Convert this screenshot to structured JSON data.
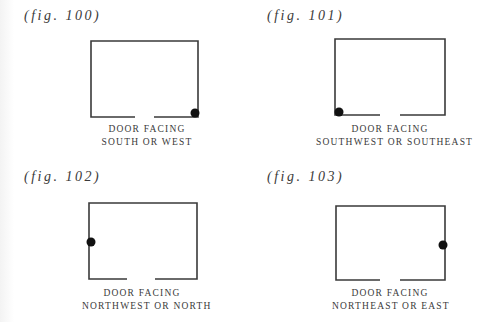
{
  "figures": [
    {
      "label": "(fig. 100)",
      "caption_line1": "DOOR FACING",
      "caption_line2": "SOUTH OR WEST",
      "room": {
        "left": 91,
        "top": 41,
        "right": 198,
        "bottom": 117,
        "door_gap": [
          135,
          154
        ]
      },
      "marker": {
        "x": 195,
        "y": 113,
        "position": "bottom-right corner"
      }
    },
    {
      "label": "(fig. 101)",
      "caption_line1": "DOOR FACING",
      "caption_line2": "SOUTHWEST OR SOUTHEAST",
      "room": {
        "left": 335,
        "top": 39,
        "right": 445,
        "bottom": 115,
        "door_gap": [
          380,
          400
        ]
      },
      "marker": {
        "x": 339,
        "y": 112,
        "position": "bottom-left corner"
      }
    },
    {
      "label": "(fig. 102)",
      "caption_line1": "DOOR FACING",
      "caption_line2": "NORTHWEST OR NORTH",
      "room": {
        "left": 89,
        "top": 203,
        "right": 197,
        "bottom": 279,
        "door_gap": [
          127,
          155
        ]
      },
      "marker": {
        "x": 91,
        "y": 242,
        "position": "middle of left wall"
      }
    },
    {
      "label": "(fig. 103)",
      "caption_line1": "DOOR FACING",
      "caption_line2": "NORTHEAST OR EAST",
      "room": {
        "left": 336,
        "top": 206,
        "right": 445,
        "bottom": 280,
        "door_gap": [
          380,
          400
        ]
      },
      "marker": {
        "x": 443,
        "y": 245,
        "position": "middle of right wall"
      }
    }
  ],
  "colors": {
    "line": "#3a3a3a",
    "marker": "#111111",
    "text": "#3a3a3a",
    "background": "#ffffff"
  }
}
